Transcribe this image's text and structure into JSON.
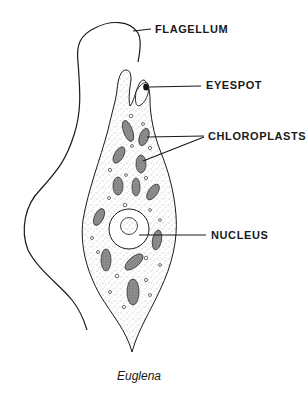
{
  "diagram": {
    "subject": "Euglena",
    "caption": "Euglena",
    "labels": {
      "flagellum": "FLAGELLUM",
      "eyespot": "EYESPOT",
      "chloroplasts": "CHLOROPLASTS",
      "nucleus": "NUCLEUS"
    },
    "colors": {
      "ink": "#1a1a1a",
      "stipple": "#555555",
      "chloroplast_fill": "#8a8a8a",
      "background": "#ffffff"
    }
  }
}
